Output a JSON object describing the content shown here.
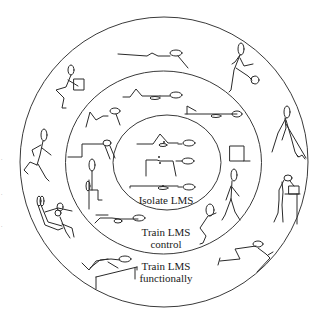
{
  "diagram": {
    "type": "concentric-rings",
    "rings": [
      {
        "id": "inner",
        "label_lines": [
          "Isolate LMS"
        ]
      },
      {
        "id": "middle",
        "label_lines": [
          "Train LMS",
          "control"
        ]
      },
      {
        "id": "outer",
        "label_lines": [
          "Train LMS",
          "functionally"
        ]
      }
    ],
    "stroke_color": "#3a3a3a",
    "background": "#ffffff",
    "figures": {
      "inner": [
        "prone-hip-lift",
        "four-point-kneeling",
        "prone-lying"
      ],
      "middle": [
        "prone-lying-arms-extended",
        "prone-leg-raise",
        "bridge-on-step",
        "step-up",
        "wall-sit",
        "supine-lying",
        "sit-to-stand",
        "seated-on-box",
        "walking",
        "squat"
      ],
      "outer": [
        "lifting-box",
        "kicking-ball",
        "raking",
        "running",
        "rowing",
        "lifting-object-to-bench",
        "lunge-stretch",
        "hurdle-over-bench"
      ]
    },
    "edge_marks": [
      ".",
      ".",
      "."
    ]
  }
}
